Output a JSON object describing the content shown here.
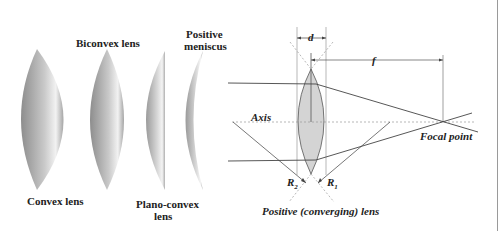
{
  "lens_types": {
    "convex": {
      "label": "Convex lens"
    },
    "biconvex": {
      "label": "Biconvex lens"
    },
    "plano_convex": {
      "label_line1": "Plano-convex",
      "label_line2": "lens"
    },
    "positive_meniscus": {
      "label_line1": "Positive",
      "label_line2": "meniscus"
    }
  },
  "ray_diagram": {
    "title": "Positive (converging) lens",
    "axis_label": "Axis",
    "focal_point_label": "Focal point",
    "thickness_label": "d",
    "focal_length_label": "f",
    "radius1_label": "R",
    "radius1_sub": "1",
    "radius2_label": "R",
    "radius2_sub": "2"
  },
  "colors": {
    "lens_fill": "#d4d4d4",
    "line": "#444444",
    "dashed": "#9a9a9a",
    "text": "#222222"
  }
}
